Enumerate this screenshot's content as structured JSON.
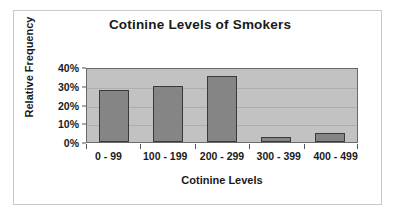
{
  "chart_data": {
    "type": "bar",
    "title": "Cotinine Levels of Smokers",
    "xlabel": "Cotinine Levels",
    "ylabel": "Relative Frequency",
    "categories": [
      "0 - 99",
      "100 - 199",
      "200 - 299",
      "300 - 399",
      "400 - 499"
    ],
    "values": [
      28,
      30,
      35,
      2.5,
      5
    ],
    "ytick_labels": [
      "0%",
      "10%",
      "20%",
      "30%",
      "40%"
    ],
    "ytick_values": [
      0,
      10,
      20,
      30,
      40
    ],
    "ylim": [
      0,
      40
    ],
    "grid": true,
    "legend": false,
    "legend_position": "none",
    "value_unit": "%",
    "colors": {
      "bar_fill": "#858585",
      "bar_border": "#3a3a3a",
      "plot_background": "#c2c2c2",
      "gridline": "#aeaeae",
      "axis": "#6a6a6a",
      "text": "#1a1a1a",
      "figure_background": "#ffffff",
      "figure_border": "#c9c9c9"
    }
  }
}
